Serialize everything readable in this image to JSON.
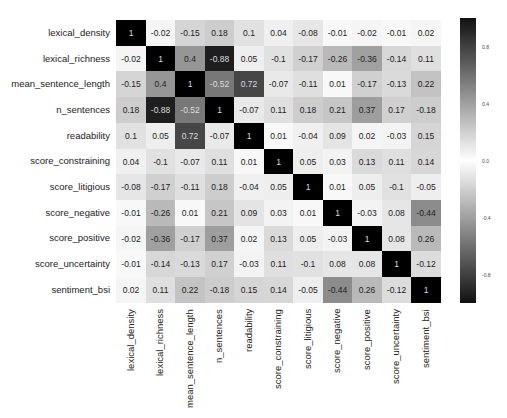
{
  "chart_data": {
    "type": "heatmap",
    "title": "",
    "xlabel": "",
    "ylabel": "",
    "labels": [
      "lexical_density",
      "lexical_richness",
      "mean_sentence_length",
      "n_sentences",
      "readability",
      "score_constraining",
      "score_litigious",
      "score_negative",
      "score_positive",
      "score_uncertainty",
      "sentiment_bsi"
    ],
    "matrix": [
      [
        1,
        -0.02,
        -0.15,
        0.18,
        0.1,
        0.04,
        -0.08,
        -0.01,
        -0.02,
        -0.01,
        0.02
      ],
      [
        -0.02,
        1,
        0.4,
        -0.88,
        0.05,
        -0.1,
        -0.17,
        -0.26,
        -0.36,
        -0.14,
        0.11
      ],
      [
        -0.15,
        0.4,
        1,
        -0.52,
        0.72,
        -0.07,
        -0.11,
        0.01,
        -0.17,
        -0.13,
        0.22
      ],
      [
        0.18,
        -0.88,
        -0.52,
        1,
        -0.07,
        0.11,
        0.18,
        0.21,
        0.37,
        0.17,
        -0.18
      ],
      [
        0.1,
        0.05,
        0.72,
        -0.07,
        1,
        0.01,
        -0.04,
        0.09,
        0.02,
        -0.03,
        0.15
      ],
      [
        0.04,
        -0.1,
        -0.07,
        0.11,
        0.01,
        1,
        0.05,
        0.03,
        0.13,
        0.11,
        0.14
      ],
      [
        -0.08,
        -0.17,
        -0.11,
        0.18,
        -0.04,
        0.05,
        1,
        0.01,
        0.05,
        -0.1,
        -0.05
      ],
      [
        -0.01,
        -0.26,
        0.01,
        0.21,
        0.09,
        0.03,
        0.01,
        1,
        -0.03,
        0.08,
        -0.44
      ],
      [
        -0.02,
        -0.36,
        -0.17,
        0.37,
        0.02,
        0.13,
        0.05,
        -0.03,
        1,
        0.08,
        0.26
      ],
      [
        -0.01,
        -0.14,
        -0.13,
        0.17,
        -0.03,
        0.11,
        -0.1,
        0.08,
        0.08,
        1,
        -0.12
      ],
      [
        0.02,
        0.11,
        0.22,
        -0.18,
        0.15,
        0.14,
        -0.05,
        -0.44,
        0.26,
        -0.12,
        1
      ]
    ],
    "colorbar": {
      "ticks": [
        "0.8",
        "0.4",
        "0.0",
        "-0.4",
        "-0.8"
      ],
      "tick_values": [
        0.8,
        0.4,
        0.0,
        -0.4,
        -0.8
      ],
      "range": [
        -1,
        1
      ],
      "colormap": "diverging dark-white-dark (gray)"
    },
    "colors": {
      "extreme": "#000000",
      "center": "#ffffff",
      "text_dark": "#222222",
      "text_light": "#dddddd"
    }
  }
}
